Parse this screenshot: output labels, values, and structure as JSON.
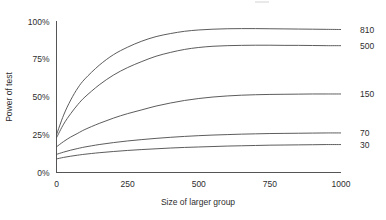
{
  "chart_data": {
    "type": "line",
    "title": "",
    "xlabel": "Size of larger group",
    "ylabel": "Power of test",
    "xlim": [
      0,
      1000
    ],
    "ylim": [
      0,
      100
    ],
    "grid": false,
    "legend_position": "right-end-labels",
    "x_ticks": [
      "0",
      "250",
      "500",
      "750",
      "1000"
    ],
    "x_tick_values": [
      0,
      250,
      500,
      750,
      1000
    ],
    "y_ticks": [
      "0%",
      "25%",
      "50%",
      "75%",
      "100%"
    ],
    "y_tick_values": [
      0,
      25,
      50,
      75,
      100
    ],
    "x": [
      0,
      25,
      50,
      75,
      100,
      150,
      200,
      250,
      300,
      350,
      400,
      450,
      500,
      550,
      600,
      650,
      700,
      750,
      800,
      850,
      900,
      950,
      1000
    ],
    "series": [
      {
        "name": "810",
        "label": "810",
        "color": "#4a4a4a",
        "values": [
          25,
          38,
          48,
          56,
          62,
          71,
          78,
          83,
          87,
          90,
          92,
          93.5,
          94.4,
          94.9,
          95.2,
          95.3,
          95.3,
          95.2,
          95.1,
          95.0,
          94.9,
          94.8,
          94.7
        ]
      },
      {
        "name": "500",
        "label": "500",
        "color": "#4a4a4a",
        "values": [
          23,
          32,
          39,
          45,
          50,
          58,
          64.5,
          69.5,
          73.5,
          77,
          79.5,
          81.5,
          82.8,
          83.6,
          84.0,
          84.2,
          84.3,
          84.3,
          84.2,
          84.2,
          84.1,
          84.0,
          84.0
        ]
      },
      {
        "name": "150",
        "label": "150",
        "color": "#4a4a4a",
        "values": [
          17,
          20.5,
          23.5,
          26,
          28.5,
          32.5,
          36,
          39,
          41.5,
          44,
          46,
          47.7,
          49,
          50,
          50.7,
          51.2,
          51.5,
          51.7,
          51.8,
          51.9,
          52.0,
          52.0,
          52.0
        ]
      },
      {
        "name": "70",
        "label": "70",
        "color": "#4a4a4a",
        "values": [
          12,
          13.5,
          14.8,
          15.9,
          16.9,
          18.5,
          19.8,
          20.9,
          21.8,
          22.6,
          23.3,
          23.9,
          24.4,
          24.8,
          25.1,
          25.4,
          25.6,
          25.8,
          25.9,
          26.0,
          26.1,
          26.2,
          26.2
        ]
      },
      {
        "name": "30",
        "label": "30",
        "color": "#4a4a4a",
        "values": [
          9,
          10,
          10.8,
          11.5,
          12.1,
          13.1,
          13.9,
          14.6,
          15.2,
          15.7,
          16.2,
          16.6,
          16.9,
          17.2,
          17.5,
          17.7,
          17.9,
          18.1,
          18.2,
          18.3,
          18.4,
          18.5,
          18.5
        ]
      }
    ]
  },
  "axes": {
    "y_axis_title": "Power of test",
    "x_axis_title": "Size of larger group"
  }
}
